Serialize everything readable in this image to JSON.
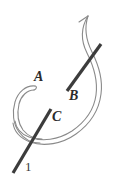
{
  "figure": {
    "type": "line-drawing",
    "canvas": {
      "width": 117,
      "height": 192,
      "background": "#ffffff"
    },
    "colors": {
      "background": "#ffffff",
      "ribbon_stroke": "#8a8a8a",
      "bar_stroke": "#3c3c3c",
      "label_text": "#2b2b2b",
      "number_text": "#3a3a3a"
    },
    "labels": [
      {
        "key": "A",
        "text": "A",
        "x": 38,
        "y": 77,
        "style": "italic-bold-serif"
      },
      {
        "key": "B",
        "text": "B",
        "x": 73,
        "y": 96,
        "style": "italic-bold-serif"
      },
      {
        "key": "C",
        "text": "C",
        "x": 56,
        "y": 117,
        "style": "italic-bold-serif"
      },
      {
        "key": "one",
        "text": "1",
        "x": 27,
        "y": 167,
        "style": "roman-serif"
      }
    ],
    "strokes": {
      "bar_upper": {
        "name": "upper-bar",
        "x1": 101,
        "y1": 44,
        "x2": 67,
        "y2": 91,
        "width": 3.2
      },
      "bar_lower": {
        "name": "lower-bar",
        "x1": 51,
        "y1": 109,
        "x2": 13,
        "y2": 173,
        "width": 3.2
      },
      "ribbon_outer": {
        "name": "ribbon-outer-edge",
        "width": 1.1
      },
      "ribbon_inner": {
        "name": "ribbon-inner-edge",
        "width": 1.1
      },
      "hook_outer": {
        "name": "hook-outer-edge",
        "width": 1.1
      },
      "hook_inner": {
        "name": "hook-inner-edge",
        "width": 1.1
      }
    }
  }
}
